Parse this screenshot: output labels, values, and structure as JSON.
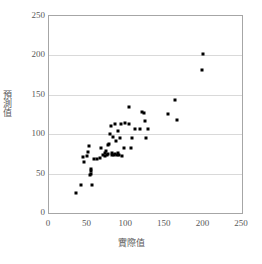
{
  "chart_data": {
    "type": "scatter",
    "title": "",
    "xlabel": "實際值",
    "ylabel": "預測值",
    "xlim": [
      0,
      250
    ],
    "ylim": [
      0,
      250
    ],
    "xticks": [
      0,
      50,
      100,
      150,
      200,
      250
    ],
    "yticks": [
      0,
      50,
      100,
      150,
      200,
      250
    ],
    "grid": "horizontal",
    "legend": "none",
    "marker": "filled-square",
    "marker_color": "#000000",
    "series": [
      {
        "name": "實際值 vs 預測值",
        "points": [
          [
            35,
            25
          ],
          [
            42,
            35
          ],
          [
            56,
            35
          ],
          [
            53,
            48
          ],
          [
            54,
            50
          ],
          [
            54,
            53
          ],
          [
            55,
            56
          ],
          [
            45,
            65
          ],
          [
            44,
            71
          ],
          [
            49,
            72
          ],
          [
            51,
            77
          ],
          [
            52,
            85
          ],
          [
            58,
            69
          ],
          [
            62,
            68
          ],
          [
            66,
            70
          ],
          [
            67,
            83
          ],
          [
            70,
            74
          ],
          [
            72,
            76
          ],
          [
            73,
            72
          ],
          [
            74,
            79
          ],
          [
            75,
            73
          ],
          [
            76,
            86
          ],
          [
            77,
            75
          ],
          [
            78,
            88
          ],
          [
            79,
            100
          ],
          [
            80,
            111
          ],
          [
            81,
            74
          ],
          [
            82,
            76
          ],
          [
            83,
            96
          ],
          [
            84,
            73
          ],
          [
            85,
            113
          ],
          [
            86,
            75
          ],
          [
            87,
            92
          ],
          [
            88,
            74
          ],
          [
            89,
            104
          ],
          [
            90,
            76
          ],
          [
            91,
            73
          ],
          [
            92,
            95
          ],
          [
            93,
            113
          ],
          [
            95,
            72
          ],
          [
            97,
            83
          ],
          [
            99,
            114
          ],
          [
            103,
            134
          ],
          [
            104,
            113
          ],
          [
            106,
            83
          ],
          [
            108,
            95
          ],
          [
            112,
            107
          ],
          [
            118,
            106
          ],
          [
            121,
            128
          ],
          [
            123,
            127
          ],
          [
            124,
            117
          ],
          [
            125,
            95
          ],
          [
            128,
            106
          ],
          [
            154,
            126
          ],
          [
            163,
            144
          ],
          [
            166,
            118
          ],
          [
            198,
            182
          ],
          [
            200,
            202
          ]
        ]
      }
    ]
  }
}
